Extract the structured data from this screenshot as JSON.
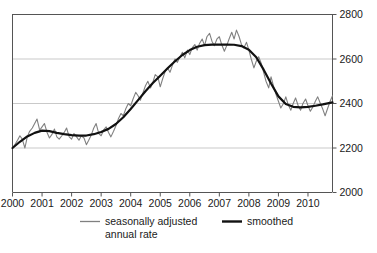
{
  "chart_data": {
    "type": "line",
    "title": "",
    "xlabel": "",
    "ylabel": "",
    "xlim": [
      2000.0,
      2010.83
    ],
    "ylim": [
      2000,
      2800
    ],
    "grid": true,
    "grid_axis": "y",
    "legend_position": "bottom",
    "x_tick_labels": [
      "2000",
      "2001",
      "2002",
      "2003",
      "2004",
      "2005",
      "2006",
      "2007",
      "2008",
      "2009",
      "2010"
    ],
    "x_tick_values": [
      2000,
      2001,
      2002,
      2003,
      2004,
      2005,
      2006,
      2007,
      2008,
      2009,
      2010
    ],
    "y_tick_labels": [
      "2000",
      "2200",
      "2400",
      "2600",
      "2800"
    ],
    "y_tick_values": [
      2000,
      2200,
      2400,
      2600,
      2800
    ],
    "colors": {
      "seasonally_adjusted": "#808080",
      "smoothed": "#111111",
      "grid": "#c9c9c9",
      "axis": "#555555",
      "text": "#1a1a1a",
      "background": "#ffffff"
    },
    "series": [
      {
        "name": "seasonally adjusted annual rate",
        "color": "#808080",
        "width": 1.1,
        "x": [
          2000.0,
          2000.08,
          2000.17,
          2000.25,
          2000.33,
          2000.42,
          2000.5,
          2000.58,
          2000.67,
          2000.75,
          2000.83,
          2000.92,
          2001.0,
          2001.08,
          2001.17,
          2001.25,
          2001.33,
          2001.42,
          2001.5,
          2001.58,
          2001.67,
          2001.75,
          2001.83,
          2001.92,
          2002.0,
          2002.08,
          2002.17,
          2002.25,
          2002.33,
          2002.42,
          2002.5,
          2002.58,
          2002.67,
          2002.75,
          2002.83,
          2002.92,
          2003.0,
          2003.08,
          2003.17,
          2003.25,
          2003.33,
          2003.42,
          2003.5,
          2003.58,
          2003.67,
          2003.75,
          2003.83,
          2003.92,
          2004.0,
          2004.08,
          2004.17,
          2004.25,
          2004.33,
          2004.42,
          2004.5,
          2004.58,
          2004.67,
          2004.75,
          2004.83,
          2004.92,
          2005.0,
          2005.08,
          2005.17,
          2005.25,
          2005.33,
          2005.42,
          2005.5,
          2005.58,
          2005.67,
          2005.75,
          2005.83,
          2005.92,
          2006.0,
          2006.08,
          2006.17,
          2006.25,
          2006.33,
          2006.42,
          2006.5,
          2006.58,
          2006.67,
          2006.75,
          2006.83,
          2006.92,
          2007.0,
          2007.08,
          2007.17,
          2007.25,
          2007.33,
          2007.42,
          2007.5,
          2007.58,
          2007.67,
          2007.75,
          2007.83,
          2007.92,
          2008.0,
          2008.08,
          2008.17,
          2008.25,
          2008.33,
          2008.42,
          2008.5,
          2008.58,
          2008.67,
          2008.75,
          2008.83,
          2008.92,
          2009.0,
          2009.08,
          2009.17,
          2009.25,
          2009.33,
          2009.42,
          2009.5,
          2009.58,
          2009.67,
          2009.75,
          2009.83,
          2009.92,
          2010.0,
          2010.08,
          2010.17,
          2010.25,
          2010.33,
          2010.42,
          2010.5,
          2010.58,
          2010.67,
          2010.75,
          2010.83
        ],
        "y": [
          2200,
          2215,
          2235,
          2255,
          2240,
          2200,
          2250,
          2275,
          2290,
          2310,
          2330,
          2280,
          2295,
          2310,
          2270,
          2245,
          2260,
          2285,
          2250,
          2240,
          2255,
          2270,
          2290,
          2250,
          2240,
          2265,
          2250,
          2235,
          2255,
          2245,
          2215,
          2235,
          2260,
          2290,
          2310,
          2265,
          2255,
          2280,
          2295,
          2270,
          2250,
          2275,
          2300,
          2330,
          2355,
          2345,
          2375,
          2400,
          2390,
          2420,
          2450,
          2435,
          2415,
          2450,
          2480,
          2500,
          2470,
          2495,
          2530,
          2520,
          2475,
          2510,
          2545,
          2560,
          2540,
          2575,
          2600,
          2585,
          2610,
          2630,
          2605,
          2640,
          2620,
          2650,
          2665,
          2640,
          2670,
          2690,
          2660,
          2700,
          2715,
          2680,
          2660,
          2690,
          2700,
          2665,
          2635,
          2660,
          2690,
          2720,
          2690,
          2730,
          2700,
          2665,
          2650,
          2675,
          2640,
          2600,
          2560,
          2590,
          2610,
          2580,
          2540,
          2500,
          2470,
          2520,
          2480,
          2440,
          2410,
          2380,
          2400,
          2430,
          2395,
          2370,
          2400,
          2425,
          2390,
          2370,
          2400,
          2420,
          2390,
          2365,
          2385,
          2410,
          2430,
          2400,
          2375,
          2345,
          2380,
          2410,
          2435
        ]
      },
      {
        "name": "smoothed",
        "color": "#111111",
        "width": 2.2,
        "x": [
          2000.0,
          2000.25,
          2000.5,
          2000.75,
          2001.0,
          2001.25,
          2001.5,
          2001.75,
          2002.0,
          2002.25,
          2002.5,
          2002.75,
          2003.0,
          2003.25,
          2003.5,
          2003.75,
          2004.0,
          2004.25,
          2004.5,
          2004.75,
          2005.0,
          2005.25,
          2005.5,
          2005.75,
          2006.0,
          2006.25,
          2006.5,
          2006.75,
          2007.0,
          2007.25,
          2007.5,
          2007.75,
          2008.0,
          2008.25,
          2008.5,
          2008.75,
          2009.0,
          2009.25,
          2009.5,
          2009.75,
          2010.0,
          2010.25,
          2010.5,
          2010.83
        ],
        "y": [
          2200,
          2228,
          2252,
          2268,
          2278,
          2276,
          2268,
          2262,
          2258,
          2256,
          2256,
          2262,
          2272,
          2286,
          2308,
          2338,
          2375,
          2415,
          2455,
          2492,
          2525,
          2558,
          2590,
          2618,
          2640,
          2655,
          2662,
          2665,
          2665,
          2665,
          2664,
          2658,
          2642,
          2608,
          2552,
          2490,
          2432,
          2398,
          2385,
          2383,
          2385,
          2390,
          2396,
          2405
        ]
      }
    ]
  },
  "legend": {
    "items": [
      {
        "label_line1": "seasonally adjusted",
        "label_line2": "annual rate",
        "color": "#808080",
        "style": "thin"
      },
      {
        "label_line1": "smoothed",
        "label_line2": "",
        "color": "#111111",
        "style": "thick"
      }
    ]
  }
}
